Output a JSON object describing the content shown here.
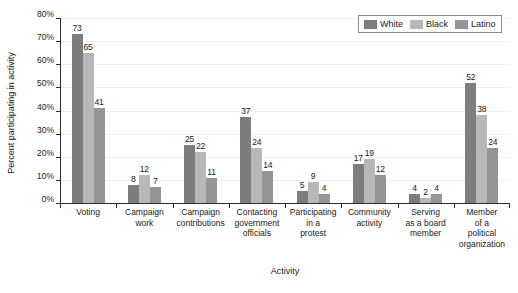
{
  "chart_data": {
    "type": "bar",
    "title": "",
    "xlabel": "Activity",
    "ylabel": "Percent participating in activity",
    "ylim": [
      0,
      80
    ],
    "ytick_labels": [
      "80%",
      "70%",
      "60%",
      "50%",
      "40%",
      "30%",
      "20%",
      "10%",
      "0%"
    ],
    "ytick_values": [
      80,
      70,
      60,
      50,
      40,
      30,
      20,
      10,
      0
    ],
    "grid": true,
    "legend_position": "top-right",
    "categories": [
      "Voting",
      "Campaign work",
      "Campaign contributions",
      "Contacting government officials",
      "Participating in a protest",
      "Community activity",
      "Serving as a board member",
      "Member of a political organization"
    ],
    "category_lines": [
      [
        "Voting"
      ],
      [
        "Campaign",
        "work"
      ],
      [
        "Campaign",
        "contributions"
      ],
      [
        "Contacting",
        "government",
        "officials"
      ],
      [
        "Participating",
        "in a",
        "protest"
      ],
      [
        "Community",
        "activity"
      ],
      [
        "Serving",
        "as a board",
        "member"
      ],
      [
        "Member",
        "of a",
        "political",
        "organization"
      ]
    ],
    "series": [
      {
        "name": "White",
        "color": "#7d7d7d",
        "values": [
          73,
          8,
          25,
          37,
          5,
          17,
          4,
          52
        ]
      },
      {
        "name": "Black",
        "color": "#b8b8b8",
        "values": [
          65,
          12,
          22,
          24,
          9,
          19,
          2,
          38
        ]
      },
      {
        "name": "Latino",
        "color": "#959595",
        "values": [
          41,
          7,
          11,
          14,
          4,
          12,
          4,
          24
        ]
      }
    ]
  },
  "legend": {
    "items": [
      {
        "label": "White",
        "color": "#7d7d7d"
      },
      {
        "label": "Black",
        "color": "#b8b8b8"
      },
      {
        "label": "Latino",
        "color": "#959595"
      }
    ]
  }
}
